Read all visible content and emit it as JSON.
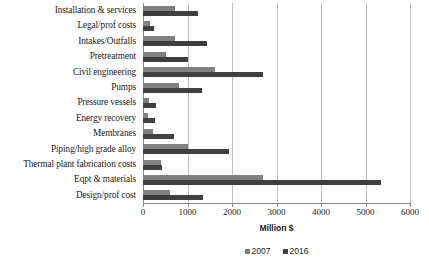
{
  "chart_data": {
    "type": "bar",
    "orientation": "horizontal",
    "title": "",
    "xlabel": "Million $",
    "ylabel": "",
    "xlim": [
      0,
      6000
    ],
    "xticks": [
      0,
      1000,
      2000,
      3000,
      4000,
      5000,
      6000
    ],
    "xtick_labels": [
      "0",
      "1000",
      "2000",
      "3000",
      "4000",
      "5000",
      "6000"
    ],
    "grid": true,
    "legend_position": "bottom",
    "categories": [
      "Installation & services",
      "Legal/prof costs",
      "Intakes/Outfalls",
      "Pretreatment",
      "Civil engineering",
      "Pumps",
      "Pressure vessels",
      "Energy recovery",
      "Membranes",
      "Piping/high grade alloy",
      "Thermal plant fabrication costs",
      "Eqpt & materials",
      "Design/prof cost"
    ],
    "series": [
      {
        "name": "2007",
        "color": "#808080",
        "values": [
          710,
          150,
          710,
          520,
          1620,
          800,
          130,
          120,
          230,
          1010,
          400,
          2700,
          600
        ]
      },
      {
        "name": "2016",
        "color": "#3f3f3f",
        "values": [
          1230,
          250,
          1430,
          1000,
          2700,
          1330,
          290,
          280,
          700,
          1930,
          420,
          5350,
          1350
        ]
      }
    ]
  },
  "legend": {
    "items": [
      {
        "label": "2007",
        "color": "#808080"
      },
      {
        "label": "2016",
        "color": "#3f3f3f"
      }
    ]
  },
  "axis": {
    "x_title": "Million $"
  },
  "colors": {
    "series_2007": "#808080",
    "series_2016": "#3f3f3f",
    "gridline": "#bfbfbf",
    "axis": "#8a8a8a",
    "text": "#1a1a1a",
    "background": "#ffffff"
  }
}
